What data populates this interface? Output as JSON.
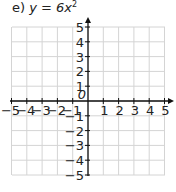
{
  "title": {
    "prefix": "e) ",
    "expr": "y = 6x",
    "exp": "2"
  },
  "chart_data": {
    "type": "line",
    "xlabel": "",
    "ylabel": "",
    "xlim": [
      -5,
      5
    ],
    "ylim": [
      -5,
      5
    ],
    "grid": true,
    "x_ticks": [
      -5,
      -4,
      -3,
      -2,
      -1,
      1,
      2,
      3,
      4,
      5
    ],
    "y_ticks": [
      -5,
      -4,
      -3,
      -2,
      -1,
      1,
      2,
      3,
      4,
      5
    ],
    "origin_label": "0",
    "series": []
  }
}
